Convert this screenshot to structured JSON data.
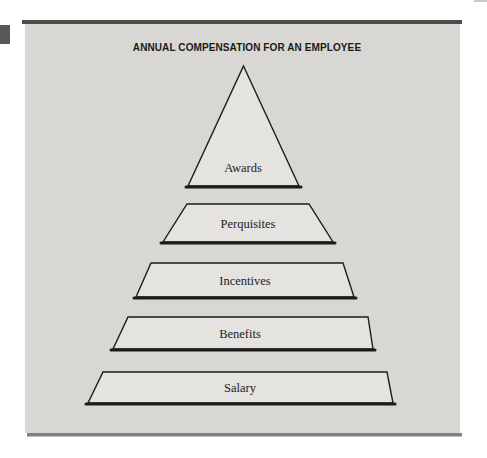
{
  "title": "ANNUAL COMPENSATION FOR AN EMPLOYEE",
  "pyramid": {
    "levels": [
      {
        "label": "Awards"
      },
      {
        "label": "Perquisites"
      },
      {
        "label": "Incentives"
      },
      {
        "label": "Benefits"
      },
      {
        "label": "Salary"
      }
    ]
  },
  "colors": {
    "page_background": "#ffffff",
    "panel_background": "#d8d7d3",
    "shape_fill": "#e4e3df",
    "shape_border": "#1c1c1a",
    "top_rule": "#4d4d4b",
    "bottom_rule": "#81817f",
    "margin_tab_square": "#58585a",
    "title_text": "#1a1a18",
    "label_text": "#22221e"
  }
}
